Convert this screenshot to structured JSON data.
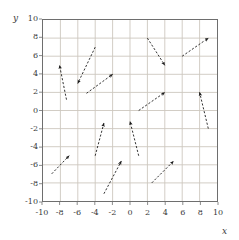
{
  "chart_data": {
    "type": "scatter",
    "title": "",
    "xlabel": "x",
    "ylabel": "y",
    "xlim": [
      -10,
      10
    ],
    "ylim": [
      -10,
      10
    ],
    "grid": true,
    "legend": "none",
    "xticks": [
      "-10",
      "-8",
      "-6",
      "-4",
      "-2",
      "0",
      "2",
      "4",
      "6",
      "8",
      "10"
    ],
    "yticks": [
      "10",
      "8",
      "6",
      "4",
      "2",
      "0",
      "-2",
      "-4",
      "-6",
      "-8",
      "-10"
    ],
    "xtick_values": [
      -10,
      -8,
      -6,
      -4,
      -2,
      0,
      2,
      4,
      6,
      8,
      10
    ],
    "ytick_values": [
      10,
      8,
      6,
      4,
      2,
      0,
      -2,
      -4,
      -6,
      -8,
      -10
    ],
    "series": [
      {
        "name": "vectors",
        "style": "dashed-arrow",
        "color": "#1a1a1a",
        "vectors": [
          {
            "id": "v1",
            "x1": -7.3,
            "y1": 1.2,
            "x2": -8.1,
            "y2": 5.0
          },
          {
            "id": "v2",
            "x1": -4.0,
            "y1": 7.0,
            "x2": -6.0,
            "y2": 3.0
          },
          {
            "id": "v3",
            "x1": -5.0,
            "y1": 1.9,
            "x2": -2.0,
            "y2": 4.0
          },
          {
            "id": "v4",
            "x1": 2.0,
            "y1": 8.0,
            "x2": 4.0,
            "y2": 5.0
          },
          {
            "id": "v5",
            "x1": 6.0,
            "y1": 6.0,
            "x2": 9.0,
            "y2": 8.0
          },
          {
            "id": "v6",
            "x1": 1.0,
            "y1": 0.0,
            "x2": 4.0,
            "y2": 2.0
          },
          {
            "id": "v7",
            "x1": 9.0,
            "y1": -2.0,
            "x2": 8.0,
            "y2": 2.0
          },
          {
            "id": "v8",
            "x1": -4.0,
            "y1": -5.0,
            "x2": -3.0,
            "y2": -1.4
          },
          {
            "id": "v9",
            "x1": 1.0,
            "y1": -5.0,
            "x2": 0.0,
            "y2": -1.2
          },
          {
            "id": "v10",
            "x1": -9.0,
            "y1": -7.0,
            "x2": -7.0,
            "y2": -5.0
          },
          {
            "id": "v11",
            "x1": -3.0,
            "y1": -9.2,
            "x2": -1.0,
            "y2": -5.6
          },
          {
            "id": "v12",
            "x1": 2.5,
            "y1": -8.0,
            "x2": 5.0,
            "y2": -5.6
          }
        ]
      }
    ],
    "colors": {
      "grid": "#ccc7bd",
      "frame": "#6e6e6e",
      "arrow": "#1a1a1a",
      "text": "#3a3a3a",
      "background": "#ffffff"
    }
  }
}
